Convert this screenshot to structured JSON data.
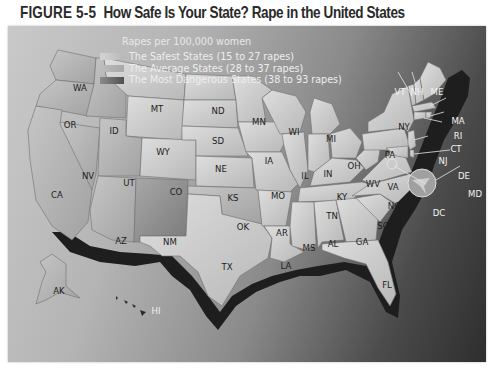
{
  "figure": {
    "number": "FIGURE 5-5",
    "title": "How Safe Is Your State? Rape in the United States"
  },
  "legend": {
    "title": "Rapes per 100,000 women",
    "items": [
      {
        "label": "The Safest States (15 to 27 rapes)",
        "color": "#c6c6c6"
      },
      {
        "label": "The Average States (28 to 37 rapes)",
        "color": "#b9b9b9"
      },
      {
        "label": "The Most Dangerous States (38 to 93 rapes)",
        "color": "#5c5c5c"
      }
    ]
  },
  "colors": {
    "background_light": "#c9c9c9",
    "background_dark": "#2e2e2e",
    "state_light": "#d0d0d0",
    "state_mid": "#b3b3b3",
    "state_dark": "#8f8f8f",
    "coast_shadow": "#1c1c1c"
  },
  "states": [
    {
      "abbr": "WA",
      "x": 72,
      "y": 62
    },
    {
      "abbr": "OR",
      "x": 62,
      "y": 99
    },
    {
      "abbr": "ID",
      "x": 106,
      "y": 105
    },
    {
      "abbr": "MT",
      "x": 149,
      "y": 83
    },
    {
      "abbr": "WY",
      "x": 155,
      "y": 126
    },
    {
      "abbr": "NV",
      "x": 80,
      "y": 150
    },
    {
      "abbr": "UT",
      "x": 121,
      "y": 157
    },
    {
      "abbr": "CO",
      "x": 168,
      "y": 166
    },
    {
      "abbr": "CA",
      "x": 49,
      "y": 169
    },
    {
      "abbr": "AZ",
      "x": 113,
      "y": 215
    },
    {
      "abbr": "NM",
      "x": 162,
      "y": 216
    },
    {
      "abbr": "ND",
      "x": 210,
      "y": 85
    },
    {
      "abbr": "SD",
      "x": 210,
      "y": 115
    },
    {
      "abbr": "NE",
      "x": 213,
      "y": 143
    },
    {
      "abbr": "KS",
      "x": 225,
      "y": 172
    },
    {
      "abbr": "OK",
      "x": 235,
      "y": 201
    },
    {
      "abbr": "TX",
      "x": 219,
      "y": 241
    },
    {
      "abbr": "MN",
      "x": 251,
      "y": 96
    },
    {
      "abbr": "IA",
      "x": 261,
      "y": 135
    },
    {
      "abbr": "MO",
      "x": 270,
      "y": 170
    },
    {
      "abbr": "AR",
      "x": 274,
      "y": 207
    },
    {
      "abbr": "LA",
      "x": 278,
      "y": 240
    },
    {
      "abbr": "WI",
      "x": 286,
      "y": 106
    },
    {
      "abbr": "IL",
      "x": 297,
      "y": 150
    },
    {
      "abbr": "MI",
      "x": 323,
      "y": 113
    },
    {
      "abbr": "IN",
      "x": 320,
      "y": 148
    },
    {
      "abbr": "OH",
      "x": 346,
      "y": 140
    },
    {
      "abbr": "KY",
      "x": 334,
      "y": 171
    },
    {
      "abbr": "TN",
      "x": 324,
      "y": 190
    },
    {
      "abbr": "MS",
      "x": 301,
      "y": 222
    },
    {
      "abbr": "AL",
      "x": 325,
      "y": 218
    },
    {
      "abbr": "GA",
      "x": 354,
      "y": 216
    },
    {
      "abbr": "FL",
      "x": 379,
      "y": 259
    },
    {
      "abbr": "SC",
      "x": 375,
      "y": 200
    },
    {
      "abbr": "NC",
      "x": 386,
      "y": 180
    },
    {
      "abbr": "VA",
      "x": 385,
      "y": 161
    },
    {
      "abbr": "WV",
      "x": 365,
      "y": 158
    },
    {
      "abbr": "PA",
      "x": 382,
      "y": 129
    },
    {
      "abbr": "NY",
      "x": 396,
      "y": 101
    },
    {
      "abbr": "VT",
      "x": 392,
      "y": 66
    },
    {
      "abbr": "NH",
      "x": 409,
      "y": 66
    },
    {
      "abbr": "ME",
      "x": 429,
      "y": 66
    },
    {
      "abbr": "MA",
      "x": 450,
      "y": 95
    },
    {
      "abbr": "RI",
      "x": 450,
      "y": 110
    },
    {
      "abbr": "CT",
      "x": 448,
      "y": 123
    },
    {
      "abbr": "NJ",
      "x": 435,
      "y": 135
    },
    {
      "abbr": "DE",
      "x": 456,
      "y": 150
    },
    {
      "abbr": "MD",
      "x": 467,
      "y": 168
    },
    {
      "abbr": "DC",
      "x": 431,
      "y": 187
    },
    {
      "abbr": "AK",
      "x": 51,
      "y": 265
    },
    {
      "abbr": "HI",
      "x": 148,
      "y": 285
    }
  ]
}
